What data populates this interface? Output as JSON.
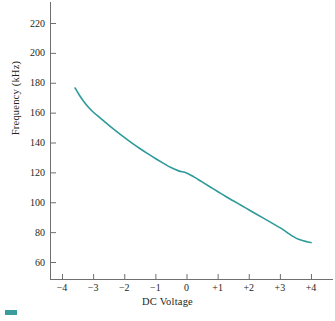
{
  "figure": {
    "corner_mark_color": "#3a9d9d"
  },
  "chart_data": {
    "type": "line",
    "title": "",
    "xlabel": "DC Voltage",
    "ylabel": "Frequency (kHz)",
    "xlim": [
      -4,
      4
    ],
    "ylim": [
      50,
      230
    ],
    "grid": false,
    "legend": false,
    "line_color": "#2f9a9a",
    "line_width": 1.6,
    "xticks": [
      -4,
      -3,
      -2,
      -1,
      0,
      1,
      2,
      3,
      4
    ],
    "xticklabels": [
      "−4",
      "−3",
      "−2",
      "−1",
      "0",
      "+1",
      "+2",
      "+3",
      "+4"
    ],
    "yticks": [
      60,
      80,
      100,
      120,
      140,
      160,
      180,
      200,
      220
    ],
    "yticklabels": [
      "60",
      "80",
      "100",
      "120",
      "140",
      "160",
      "180",
      "200",
      "220"
    ],
    "series": [
      {
        "name": "Frequency vs DC Voltage",
        "x": [
          -3.58,
          -3.45,
          -3.3,
          -3.15,
          -3.0,
          -2.75,
          -2.5,
          -2.25,
          -2.0,
          -1.75,
          -1.5,
          -1.25,
          -1.0,
          -0.75,
          -0.5,
          -0.25,
          0.0,
          0.25,
          0.5,
          0.75,
          1.0,
          1.25,
          1.5,
          1.75,
          2.0,
          2.25,
          2.5,
          2.75,
          3.0,
          3.15,
          3.3,
          3.45,
          3.6,
          3.75,
          3.9,
          4.0
        ],
        "y": [
          176.5,
          172.0,
          167.5,
          163.6,
          160.4,
          156.0,
          151.6,
          147.4,
          143.4,
          139.6,
          136.0,
          132.6,
          129.3,
          126.2,
          123.2,
          121.0,
          119.6,
          116.8,
          113.6,
          110.4,
          107.2,
          104.0,
          101.0,
          98.0,
          95.0,
          92.0,
          89.0,
          86.0,
          83.0,
          81.0,
          78.8,
          76.8,
          75.2,
          74.2,
          73.4,
          73.0
        ]
      }
    ]
  }
}
